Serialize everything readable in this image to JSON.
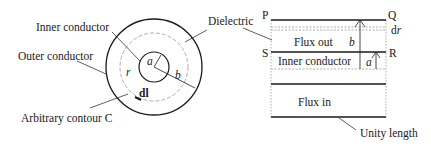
{
  "coax_cross_section": {
    "labels": {
      "inner_conductor": "Inner conductor",
      "outer_conductor": "Outer conductor",
      "dielectric": "Dielectric",
      "arbitrary_contour": "Arbitrary contour C",
      "radius_inner": "a",
      "radius_outer": "b",
      "radius_contour": "r",
      "line_element": "dl"
    }
  },
  "flux_rectangle": {
    "corners": {
      "p": "P",
      "q": "Q",
      "r": "R",
      "s": "S"
    },
    "labels": {
      "flux_out": "Flux out",
      "inner_conductor": "Inner conductor",
      "flux_in": "Flux in",
      "unity_length": "Unity length",
      "radius_outer": "b",
      "radius_inner": "a",
      "strip_width": "dr"
    }
  },
  "colors": {
    "line": "#1a1a1a",
    "dashed": "#9a9a9a"
  }
}
